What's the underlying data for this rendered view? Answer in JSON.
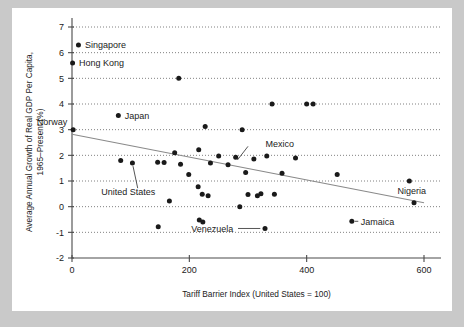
{
  "chart_data": {
    "type": "scatter",
    "title": "",
    "xlabel": "Tariff Barrier Index (United States = 100)",
    "ylabel_line1": "Average Annual Growth of Real GDP Per Capita,",
    "ylabel_line2": "1965–Present (%)",
    "xlim": [
      0,
      640
    ],
    "ylim": [
      -2,
      7.4
    ],
    "xticks": [
      0,
      200,
      400,
      600
    ],
    "xticklabels": [
      "0",
      "200",
      "400",
      "600"
    ],
    "yticks": [
      -2,
      -1,
      0,
      1,
      2,
      3,
      4,
      5,
      6,
      7
    ],
    "yticklabels": [
      "-2",
      "-1",
      "0",
      "1",
      "2",
      "3",
      "4",
      "5",
      "6",
      "7"
    ],
    "grid": "horizontal-dotted",
    "legend": "none",
    "point_color": "#1a1a1a",
    "trendline_color": "#8a8a8a",
    "trendline": {
      "x_start": 0,
      "y_start": 2.82,
      "x_end": 600,
      "y_end": 0.15
    },
    "points": [
      {
        "x": 11,
        "y": 6.3,
        "label": "Singapore"
      },
      {
        "x": 1,
        "y": 5.6,
        "label": "Hong Kong"
      },
      {
        "x": 182,
        "y": 5.0,
        "label": ""
      },
      {
        "x": 79,
        "y": 3.55,
        "label": "Japan"
      },
      {
        "x": 341,
        "y": 4.0,
        "label": ""
      },
      {
        "x": 400,
        "y": 4.0,
        "label": ""
      },
      {
        "x": 411,
        "y": 4.0,
        "label": ""
      },
      {
        "x": 2,
        "y": 3.0,
        "label": "Norway"
      },
      {
        "x": 227,
        "y": 3.12,
        "label": ""
      },
      {
        "x": 290,
        "y": 3.0,
        "label": ""
      },
      {
        "x": 175,
        "y": 2.1,
        "label": ""
      },
      {
        "x": 216,
        "y": 2.22,
        "label": ""
      },
      {
        "x": 250,
        "y": 1.97,
        "label": ""
      },
      {
        "x": 279,
        "y": 1.93,
        "label": "Mexico"
      },
      {
        "x": 310,
        "y": 1.86,
        "label": ""
      },
      {
        "x": 332,
        "y": 1.97,
        "label": ""
      },
      {
        "x": 381,
        "y": 1.9,
        "label": ""
      },
      {
        "x": 83,
        "y": 1.8,
        "label": ""
      },
      {
        "x": 103,
        "y": 1.7,
        "label": "United States"
      },
      {
        "x": 146,
        "y": 1.73,
        "label": ""
      },
      {
        "x": 157,
        "y": 1.72,
        "label": ""
      },
      {
        "x": 185,
        "y": 1.65,
        "label": ""
      },
      {
        "x": 236,
        "y": 1.7,
        "label": ""
      },
      {
        "x": 266,
        "y": 1.63,
        "label": ""
      },
      {
        "x": 199,
        "y": 1.25,
        "label": ""
      },
      {
        "x": 296,
        "y": 1.33,
        "label": ""
      },
      {
        "x": 358,
        "y": 1.3,
        "label": ""
      },
      {
        "x": 452,
        "y": 1.25,
        "label": ""
      },
      {
        "x": 575,
        "y": 1.0,
        "label": ""
      },
      {
        "x": 215,
        "y": 0.78,
        "label": ""
      },
      {
        "x": 222,
        "y": 0.48,
        "label": ""
      },
      {
        "x": 232,
        "y": 0.43,
        "label": ""
      },
      {
        "x": 300,
        "y": 0.47,
        "label": ""
      },
      {
        "x": 322,
        "y": 0.5,
        "label": ""
      },
      {
        "x": 316,
        "y": 0.43,
        "label": ""
      },
      {
        "x": 345,
        "y": 0.48,
        "label": ""
      },
      {
        "x": 166,
        "y": 0.22,
        "label": ""
      },
      {
        "x": 583,
        "y": 0.15,
        "label": "Nigeria"
      },
      {
        "x": 286,
        "y": 0.0,
        "label": ""
      },
      {
        "x": 147,
        "y": -0.78,
        "label": ""
      },
      {
        "x": 217,
        "y": -0.52,
        "label": ""
      },
      {
        "x": 223,
        "y": -0.6,
        "label": ""
      },
      {
        "x": 477,
        "y": -0.57,
        "label": "Jamaica"
      },
      {
        "x": 329,
        "y": -0.85,
        "label": "Venezuela"
      }
    ],
    "annotations": [
      {
        "text": "Singapore",
        "x": 22,
        "y": 6.3,
        "anchor": "start"
      },
      {
        "text": "Hong Kong",
        "x": 12,
        "y": 5.6,
        "anchor": "start"
      },
      {
        "text": "Japan",
        "x": 90,
        "y": 3.55,
        "anchor": "start"
      },
      {
        "text": "Norway",
        "x": -8,
        "y": 3.3,
        "anchor": "end"
      },
      {
        "text": "Mexico",
        "x": 330,
        "y": 2.45,
        "anchor": "start"
      },
      {
        "text": "United States",
        "x": 50,
        "y": 0.6,
        "anchor": "start"
      },
      {
        "text": "Venezuela",
        "x": 275,
        "y": -0.85,
        "anchor": "end"
      },
      {
        "text": "Jamaica",
        "x": 492,
        "y": -0.57,
        "anchor": "start"
      },
      {
        "text": "Nigeria",
        "x": 555,
        "y": 0.62,
        "anchor": "start"
      }
    ]
  }
}
